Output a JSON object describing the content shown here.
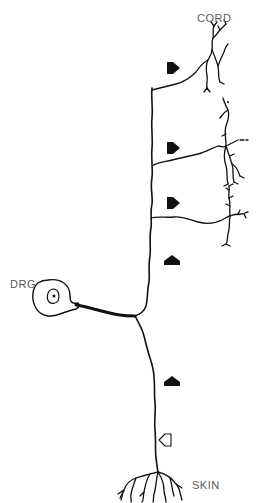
{
  "diagram": {
    "type": "neuron-schematic",
    "labels": {
      "cord": "CORD",
      "drg": "DRG",
      "skin": "SKIN"
    },
    "components": {
      "cell_body": "DRG cell body with nucleus",
      "central_axon": "ascending branch to spinal cord with three collateral arbors",
      "peripheral_axon": "descending branch to skin with terminal arbor"
    },
    "arrows": [
      {
        "id": "arrow-1",
        "style": "filled",
        "direction": "right",
        "x": 175,
        "y": 68
      },
      {
        "id": "arrow-2",
        "style": "filled",
        "direction": "right",
        "x": 175,
        "y": 148
      },
      {
        "id": "arrow-3",
        "style": "filled",
        "direction": "right",
        "x": 175,
        "y": 203
      },
      {
        "id": "arrow-4",
        "style": "filled",
        "direction": "up",
        "x": 172,
        "y": 262
      },
      {
        "id": "arrow-5",
        "style": "filled",
        "direction": "up",
        "x": 172,
        "y": 382
      },
      {
        "id": "arrow-6",
        "style": "outline",
        "direction": "left",
        "x": 166,
        "y": 440
      }
    ],
    "colors": {
      "ink": "#111111",
      "label": "#5a5a5a",
      "background": "#ffffff"
    }
  }
}
